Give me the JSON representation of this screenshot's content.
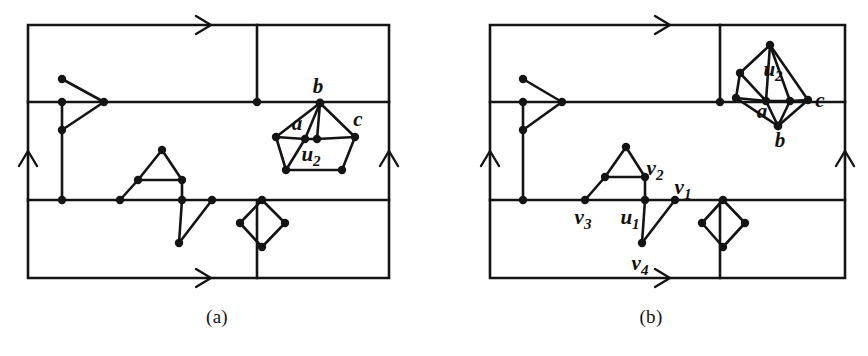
{
  "figure": {
    "title_visible": false,
    "stroke_color": "#141414",
    "background_color": "#ffffff",
    "vertex_color": "#141414",
    "panels": [
      {
        "id": "a",
        "caption": "(a)",
        "labels": [
          {
            "name": "b",
            "text": "b",
            "sub": "",
            "x": 318,
            "y": 93
          },
          {
            "name": "a",
            "text": "a",
            "sub": "",
            "x": 297,
            "y": 130
          },
          {
            "name": "c",
            "text": "c",
            "sub": "",
            "x": 358,
            "y": 126
          },
          {
            "name": "u2",
            "text": "u",
            "sub": "2",
            "x": 316,
            "y": 158
          }
        ],
        "torus_arrows": [
          "top-horizontal",
          "bottom-horizontal",
          "left-vertical",
          "right-vertical"
        ]
      },
      {
        "id": "b",
        "caption": "(b)",
        "labels": [
          {
            "name": "u2",
            "text": "u",
            "sub": "2",
            "x": 778,
            "y": 70
          },
          {
            "name": "c",
            "text": "c",
            "sub": "",
            "x": 818,
            "y": 102
          },
          {
            "name": "a",
            "text": "a",
            "sub": "",
            "x": 765,
            "y": 113
          },
          {
            "name": "b",
            "text": "b",
            "sub": "",
            "x": 782,
            "y": 141
          },
          {
            "name": "v2",
            "text": "v",
            "sub": "2",
            "x": 649,
            "y": 172
          },
          {
            "name": "v1",
            "text": "v",
            "sub": "1",
            "x": 677,
            "y": 192
          },
          {
            "name": "v3",
            "text": "v",
            "sub": "3",
            "x": 580,
            "y": 222
          },
          {
            "name": "u1",
            "text": "u",
            "sub": "1",
            "x": 627,
            "y": 222
          },
          {
            "name": "v4",
            "text": "v",
            "sub": "4",
            "x": 638,
            "y": 266
          }
        ],
        "torus_arrows": [
          "top-horizontal",
          "bottom-horizontal",
          "left-vertical",
          "right-vertical"
        ]
      }
    ]
  },
  "chart_data": {
    "type": "diagram",
    "panels": [
      {
        "id": "a",
        "frame": {
          "x0": 28,
          "y0": 25,
          "x1": 389,
          "y1": 278
        },
        "grid_lines": {
          "horizontal_y": [
            102,
            200
          ],
          "vertical_x": [
            257
          ]
        },
        "vertices": [
          {
            "name": "p1",
            "x": 62,
            "y": 79
          },
          {
            "name": "p2",
            "x": 62,
            "y": 102
          },
          {
            "name": "p3",
            "x": 62,
            "y": 130
          },
          {
            "name": "p4",
            "x": 62,
            "y": 200
          },
          {
            "name": "p5",
            "x": 104,
            "y": 102
          },
          {
            "name": "p6",
            "x": 257,
            "y": 102
          },
          {
            "name": "p7",
            "x": 257,
            "y": 200
          },
          {
            "name": "p8",
            "x": 162,
            "y": 150
          },
          {
            "name": "p9",
            "x": 138,
            "y": 180
          },
          {
            "name": "p10",
            "x": 182,
            "y": 180
          },
          {
            "name": "p11",
            "x": 120,
            "y": 200
          },
          {
            "name": "p12",
            "x": 182,
            "y": 200
          },
          {
            "name": "p13",
            "x": 179,
            "y": 243
          },
          {
            "name": "p14",
            "x": 212,
            "y": 200
          },
          {
            "name": "p15",
            "x": 262,
            "y": 200
          },
          {
            "name": "p16",
            "x": 240,
            "y": 223
          },
          {
            "name": "p17",
            "x": 285,
            "y": 223
          },
          {
            "name": "p18",
            "x": 262,
            "y": 247
          },
          {
            "name": "b",
            "x": 320,
            "y": 103
          },
          {
            "name": "aL",
            "x": 276,
            "y": 137
          },
          {
            "name": "a",
            "x": 305,
            "y": 139
          },
          {
            "name": "u2",
            "x": 317,
            "y": 139
          },
          {
            "name": "cR",
            "x": 355,
            "y": 137
          },
          {
            "name": "q1",
            "x": 286,
            "y": 170
          },
          {
            "name": "q2",
            "x": 342,
            "y": 170
          }
        ]
      },
      {
        "id": "b",
        "frame": {
          "x0": 490,
          "y0": 25,
          "x1": 845,
          "y1": 278
        },
        "grid_lines": {
          "horizontal_y": [
            102,
            200
          ],
          "vertical_x": [
            720
          ]
        },
        "vertices": [
          {
            "name": "p1",
            "x": 523,
            "y": 79
          },
          {
            "name": "p2",
            "x": 523,
            "y": 102
          },
          {
            "name": "p3",
            "x": 523,
            "y": 130
          },
          {
            "name": "p4",
            "x": 523,
            "y": 200
          },
          {
            "name": "p5",
            "x": 562,
            "y": 102
          },
          {
            "name": "p6",
            "x": 720,
            "y": 102
          },
          {
            "name": "p7",
            "x": 720,
            "y": 200
          },
          {
            "name": "v2t",
            "x": 626,
            "y": 147
          },
          {
            "name": "v2m",
            "x": 605,
            "y": 177
          },
          {
            "name": "v2",
            "x": 645,
            "y": 177
          },
          {
            "name": "v3",
            "x": 585,
            "y": 200
          },
          {
            "name": "u1",
            "x": 645,
            "y": 200
          },
          {
            "name": "v4",
            "x": 642,
            "y": 243
          },
          {
            "name": "v1",
            "x": 675,
            "y": 200
          },
          {
            "name": "d1",
            "x": 723,
            "y": 200
          },
          {
            "name": "d2",
            "x": 702,
            "y": 223
          },
          {
            "name": "d3",
            "x": 745,
            "y": 223
          },
          {
            "name": "d4",
            "x": 723,
            "y": 247
          },
          {
            "name": "k1",
            "x": 770,
            "y": 45
          },
          {
            "name": "k2",
            "x": 740,
            "y": 73
          },
          {
            "name": "k3",
            "x": 736,
            "y": 98
          },
          {
            "name": "k4",
            "x": 766,
            "y": 101
          },
          {
            "name": "k5",
            "x": 790,
            "y": 101
          },
          {
            "name": "k6",
            "x": 808,
            "y": 100
          },
          {
            "name": "b",
            "x": 778,
            "y": 126
          }
        ]
      }
    ]
  }
}
